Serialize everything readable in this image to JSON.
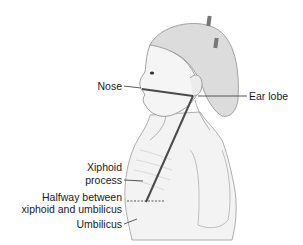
{
  "figure": {
    "line_color": "#4a4a4a",
    "skin_color": "#f1f1f1",
    "outline_color": "#9a9a9a",
    "hair_color": "#d8d8d8"
  },
  "labels": {
    "nose": "Nose",
    "ear_lobe": "Ear lobe",
    "xiphoid_line1": "Xiphoid",
    "xiphoid_line2": "process",
    "halfway_line1": "Halfway between",
    "halfway_line2": "xiphoid and umbilicus",
    "umbilicus": "Umbilicus"
  }
}
